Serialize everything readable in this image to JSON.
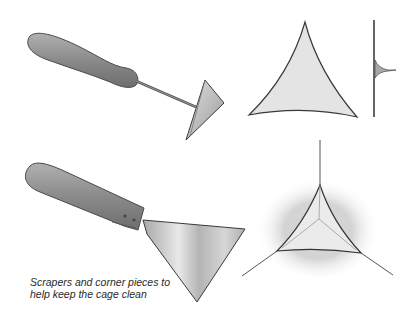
{
  "caption": {
    "line1": "Scrapers and corner pieces to",
    "line2": "help keep the cage clean"
  },
  "illustrations": [
    {
      "id": "hoe-scraper",
      "label": "Scraper with triangular blade on rod"
    },
    {
      "id": "corner-piece-front",
      "label": "Triangular corner piece, front view"
    },
    {
      "id": "corner-piece-side",
      "label": "Corner piece, side view"
    },
    {
      "id": "spatula-scraper",
      "label": "Flat-blade scraper with riveted handle"
    },
    {
      "id": "corner-piece-installed",
      "label": "Corner piece fitted into cage corner"
    }
  ],
  "colors": {
    "outline": "#3a3a3a",
    "handle": "#8c8c8c",
    "metal": "#c8c8c8",
    "piece": "#e2e2e2"
  }
}
